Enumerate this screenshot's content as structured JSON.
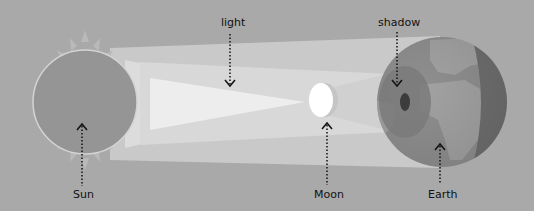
{
  "diagram": {
    "labels": {
      "light": "light",
      "shadow": "shadow",
      "sun": "Sun",
      "moon": "Moon",
      "earth": "Earth"
    },
    "colors": {
      "background": "#a9a9a9",
      "sun": "#959595",
      "sun_rays": "#b8b8b8",
      "light_beam": "#d2d2d2",
      "light_core": "#ececec",
      "moon": "#ffffff",
      "earth_ocean": "#8e8e8e",
      "earth_land": "#a0a0a0",
      "earth_night": "#6e6e6e",
      "penumbra": "#7a7a7a",
      "umbra": "#3c3c3c",
      "arrow": "#111111"
    }
  }
}
